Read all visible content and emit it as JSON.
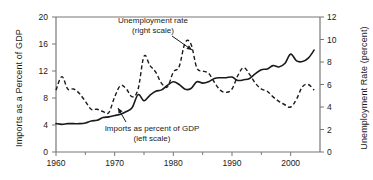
{
  "chart_data": {
    "type": "line",
    "title": "",
    "xlabel": "",
    "ylabel": "Imports as a Percent of GDP",
    "y2label": "Unemployment Rate (percent)",
    "xlim": [
      1960,
      2005
    ],
    "ylim": [
      0,
      20
    ],
    "y2lim": [
      0,
      12
    ],
    "grid": false,
    "legend_position": "inline-annotations",
    "xticks": [
      1960,
      1970,
      1980,
      1990,
      2000
    ],
    "xtick_labels": [
      "1960",
      "1970",
      "1980",
      "1990",
      "2000"
    ],
    "xminor_ticks": [
      1965,
      1975,
      1985,
      1995
    ],
    "yticks_left": [
      0,
      4,
      8,
      12,
      16,
      20
    ],
    "ytick_labels_left": [
      "0",
      "4",
      "8",
      "12",
      "16",
      "20"
    ],
    "yticks_right": [
      0,
      2,
      4,
      6,
      8,
      10,
      12
    ],
    "ytick_labels_right": [
      "0",
      "2",
      "4",
      "6",
      "8",
      "10",
      "12"
    ],
    "annotations": [
      {
        "name": "unemployment-annotation",
        "line1": "Unemployment rate",
        "line2": "(right scale)"
      },
      {
        "name": "imports-annotation",
        "line1": "Imports as percent of GDP",
        "line2": "(left scale)"
      }
    ],
    "series": [
      {
        "name": "Imports as a Percent of GDP",
        "style": "solid",
        "axis": "left",
        "x": [
          1960,
          1961,
          1962,
          1963,
          1964,
          1965,
          1966,
          1967,
          1968,
          1969,
          1970,
          1971,
          1972,
          1973,
          1974,
          1975,
          1976,
          1977,
          1978,
          1979,
          1980,
          1981,
          1982,
          1983,
          1984,
          1985,
          1986,
          1987,
          1988,
          1989,
          1990,
          1991,
          1992,
          1993,
          1994,
          1995,
          1996,
          1997,
          1998,
          1999,
          2000,
          2001,
          2002,
          2003,
          2004
        ],
        "values": [
          4.2,
          4.1,
          4.2,
          4.2,
          4.2,
          4.3,
          4.6,
          4.7,
          5.1,
          5.2,
          5.4,
          5.6,
          6.0,
          6.6,
          8.5,
          7.6,
          8.4,
          9.0,
          9.2,
          9.9,
          10.4,
          10.0,
          9.3,
          9.4,
          10.4,
          10.2,
          10.4,
          10.9,
          11.0,
          11.0,
          11.1,
          10.6,
          10.7,
          10.9,
          11.6,
          12.2,
          12.3,
          12.8,
          12.6,
          13.1,
          14.5,
          13.5,
          13.4,
          13.9,
          15.1
        ]
      },
      {
        "name": "Unemployment rate",
        "style": "dashed",
        "axis": "right",
        "x": [
          1960,
          1961,
          1962,
          1963,
          1964,
          1965,
          1966,
          1967,
          1968,
          1969,
          1970,
          1971,
          1972,
          1973,
          1974,
          1975,
          1976,
          1977,
          1978,
          1979,
          1980,
          1981,
          1982,
          1983,
          1984,
          1985,
          1986,
          1987,
          1988,
          1989,
          1990,
          1991,
          1992,
          1993,
          1994,
          1995,
          1996,
          1997,
          1998,
          1999,
          2000,
          2001,
          2002,
          2003,
          2004
        ],
        "values": [
          5.5,
          6.7,
          5.6,
          5.6,
          5.2,
          4.5,
          3.8,
          3.8,
          3.6,
          3.5,
          4.9,
          5.9,
          5.6,
          4.9,
          5.6,
          8.5,
          7.7,
          7.1,
          6.1,
          5.8,
          7.1,
          7.6,
          9.7,
          9.6,
          7.5,
          7.2,
          7.0,
          6.2,
          5.5,
          5.3,
          5.6,
          6.8,
          7.5,
          6.9,
          6.1,
          5.6,
          5.4,
          4.9,
          4.5,
          4.2,
          4.0,
          4.7,
          5.8,
          6.0,
          5.5
        ]
      }
    ]
  }
}
